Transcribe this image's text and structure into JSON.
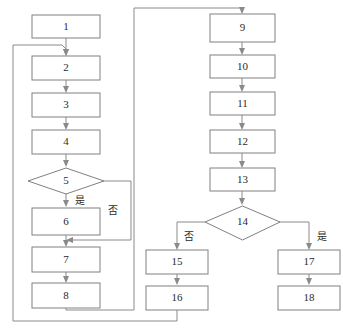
{
  "diagram": {
    "type": "flowchart",
    "title": "",
    "colors": {
      "background": "#ffffff",
      "node_stroke": "#808080",
      "node_fill": "#ffffff",
      "edge_stroke": "#8a8a8a",
      "text": "#2b2b2b"
    },
    "nodes": [
      {
        "id": "n1",
        "label": "1",
        "shape": "rect",
        "column": "left"
      },
      {
        "id": "n2",
        "label": "2",
        "shape": "rect",
        "column": "left"
      },
      {
        "id": "n3",
        "label": "3",
        "shape": "rect",
        "column": "left"
      },
      {
        "id": "n4",
        "label": "4",
        "shape": "rect",
        "column": "left"
      },
      {
        "id": "n5",
        "label": "5",
        "shape": "diamond",
        "column": "left"
      },
      {
        "id": "n6",
        "label": "6",
        "shape": "rect",
        "column": "left"
      },
      {
        "id": "n7",
        "label": "7",
        "shape": "rect",
        "column": "left"
      },
      {
        "id": "n8",
        "label": "8",
        "shape": "rect",
        "column": "left"
      },
      {
        "id": "n9",
        "label": "9",
        "shape": "rect",
        "column": "right"
      },
      {
        "id": "n10",
        "label": "10",
        "shape": "rect",
        "column": "right"
      },
      {
        "id": "n11",
        "label": "11",
        "shape": "rect",
        "column": "right"
      },
      {
        "id": "n12",
        "label": "12",
        "shape": "rect",
        "column": "right"
      },
      {
        "id": "n13",
        "label": "13",
        "shape": "rect",
        "column": "right"
      },
      {
        "id": "n14",
        "label": "14",
        "shape": "diamond",
        "column": "right"
      },
      {
        "id": "n15",
        "label": "15",
        "shape": "rect",
        "column": "right-no"
      },
      {
        "id": "n16",
        "label": "16",
        "shape": "rect",
        "column": "right-no"
      },
      {
        "id": "n17",
        "label": "17",
        "shape": "rect",
        "column": "right-yes"
      },
      {
        "id": "n18",
        "label": "18",
        "shape": "rect",
        "column": "right-yes"
      }
    ],
    "edge_labels": {
      "d5_yes": "是",
      "d5_no": "否",
      "d14_no": "否",
      "d14_yes": "是"
    },
    "edges": [
      {
        "from": "n1",
        "to": "n2",
        "label": ""
      },
      {
        "from": "n2",
        "to": "n3",
        "label": ""
      },
      {
        "from": "n3",
        "to": "n4",
        "label": ""
      },
      {
        "from": "n4",
        "to": "n5",
        "label": ""
      },
      {
        "from": "n5",
        "to": "n6",
        "label": "是"
      },
      {
        "from": "n5",
        "to": "n7",
        "label": "否"
      },
      {
        "from": "n6",
        "to": "n7",
        "label": ""
      },
      {
        "from": "n7",
        "to": "n8",
        "label": ""
      },
      {
        "from": "n8",
        "to": "n9",
        "label": ""
      },
      {
        "from": "n9",
        "to": "n10",
        "label": ""
      },
      {
        "from": "n10",
        "to": "n11",
        "label": ""
      },
      {
        "from": "n11",
        "to": "n12",
        "label": ""
      },
      {
        "from": "n12",
        "to": "n13",
        "label": ""
      },
      {
        "from": "n13",
        "to": "n14",
        "label": ""
      },
      {
        "from": "n14",
        "to": "n15",
        "label": "否"
      },
      {
        "from": "n14",
        "to": "n17",
        "label": "是"
      },
      {
        "from": "n15",
        "to": "n16",
        "label": ""
      },
      {
        "from": "n17",
        "to": "n18",
        "label": ""
      },
      {
        "from": "n16",
        "to": "n2",
        "label": ""
      }
    ]
  }
}
